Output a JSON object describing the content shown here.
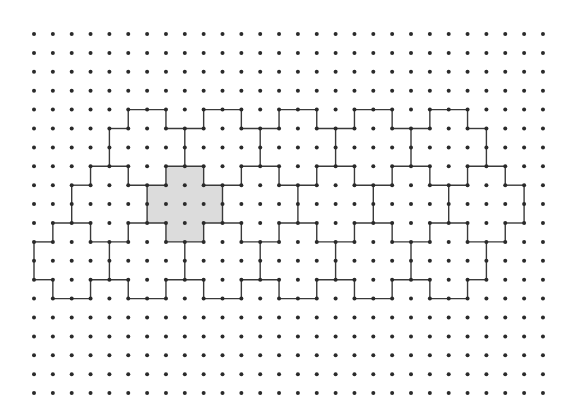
{
  "diagram": {
    "type": "dot-grid-polyomino-tiling",
    "grid": {
      "columns": 28,
      "rows": 20,
      "origin_x": 34,
      "origin_y": 34,
      "spacing_x": 18.85,
      "spacing_y": 18.9,
      "dot_radius": 2,
      "dot_color": "#2a2a2a"
    },
    "line_color": "#3a3a3a",
    "shade_color": "#dcdcdc",
    "shaded_cross": {
      "description": "plus-shaped pentomino highlighted in gray",
      "vertices": [
        [
          7,
          7
        ],
        [
          9,
          7
        ],
        [
          9,
          8
        ],
        [
          10,
          8
        ],
        [
          10,
          10
        ],
        [
          9,
          10
        ],
        [
          9,
          11
        ],
        [
          7,
          11
        ],
        [
          7,
          10
        ],
        [
          6,
          10
        ],
        [
          6,
          8
        ],
        [
          7,
          8
        ]
      ]
    },
    "horizontal_segments": [
      {
        "row": 4,
        "spans": [
          [
            5,
            7
          ],
          [
            9,
            11
          ],
          [
            13,
            15
          ],
          [
            17,
            19
          ],
          [
            21,
            23
          ]
        ]
      },
      {
        "row": 5,
        "spans": [
          [
            4,
            5
          ],
          [
            7,
            9
          ],
          [
            11,
            13
          ],
          [
            15,
            17
          ],
          [
            19,
            21
          ],
          [
            23,
            24
          ]
        ]
      },
      {
        "row": 7,
        "spans": [
          [
            3,
            5
          ],
          [
            7,
            9
          ],
          [
            11,
            13
          ],
          [
            15,
            17
          ],
          [
            19,
            21
          ],
          [
            23,
            25
          ]
        ]
      },
      {
        "row": 8,
        "spans": [
          [
            2,
            3
          ],
          [
            5,
            7
          ],
          [
            9,
            11
          ],
          [
            13,
            15
          ],
          [
            17,
            19
          ],
          [
            21,
            23
          ],
          [
            25,
            26
          ]
        ]
      },
      {
        "row": 10,
        "spans": [
          [
            1,
            3
          ],
          [
            5,
            7
          ],
          [
            9,
            11
          ],
          [
            13,
            15
          ],
          [
            17,
            19
          ],
          [
            21,
            23
          ],
          [
            25,
            26
          ]
        ]
      },
      {
        "row": 11,
        "spans": [
          [
            0,
            1
          ],
          [
            3,
            5
          ],
          [
            7,
            9
          ],
          [
            11,
            13
          ],
          [
            15,
            17
          ],
          [
            19,
            21
          ],
          [
            23,
            25
          ]
        ]
      },
      {
        "row": 13,
        "spans": [
          [
            0,
            1
          ],
          [
            3,
            5
          ],
          [
            7,
            9
          ],
          [
            11,
            13
          ],
          [
            15,
            17
          ],
          [
            19,
            21
          ],
          [
            23,
            24
          ]
        ]
      },
      {
        "row": 14,
        "spans": [
          [
            1,
            3
          ],
          [
            5,
            7
          ],
          [
            9,
            11
          ],
          [
            13,
            15
          ],
          [
            17,
            19
          ],
          [
            21,
            23
          ]
        ]
      }
    ],
    "vertical_segments": [
      {
        "rows": [
          4,
          5
        ],
        "cols": [
          5,
          7,
          9,
          11,
          13,
          15,
          17,
          19,
          21,
          23
        ]
      },
      {
        "rows": [
          5,
          7
        ],
        "cols": [
          4,
          8,
          12,
          16,
          20,
          24
        ]
      },
      {
        "rows": [
          7,
          8
        ],
        "cols": [
          3,
          5,
          7,
          9,
          11,
          13,
          15,
          17,
          19,
          21,
          23,
          25
        ]
      },
      {
        "rows": [
          8,
          10
        ],
        "cols": [
          2,
          6,
          10,
          14,
          18,
          22,
          26
        ]
      },
      {
        "rows": [
          10,
          11
        ],
        "cols": [
          1,
          3,
          5,
          7,
          9,
          11,
          13,
          15,
          17,
          19,
          21,
          23,
          25
        ]
      },
      {
        "rows": [
          11,
          13
        ],
        "cols": [
          0,
          4,
          8,
          12,
          16,
          20,
          24
        ]
      },
      {
        "rows": [
          13,
          14
        ],
        "cols": [
          1,
          3,
          5,
          7,
          9,
          11,
          13,
          15,
          17,
          19,
          21,
          23
        ]
      }
    ]
  }
}
